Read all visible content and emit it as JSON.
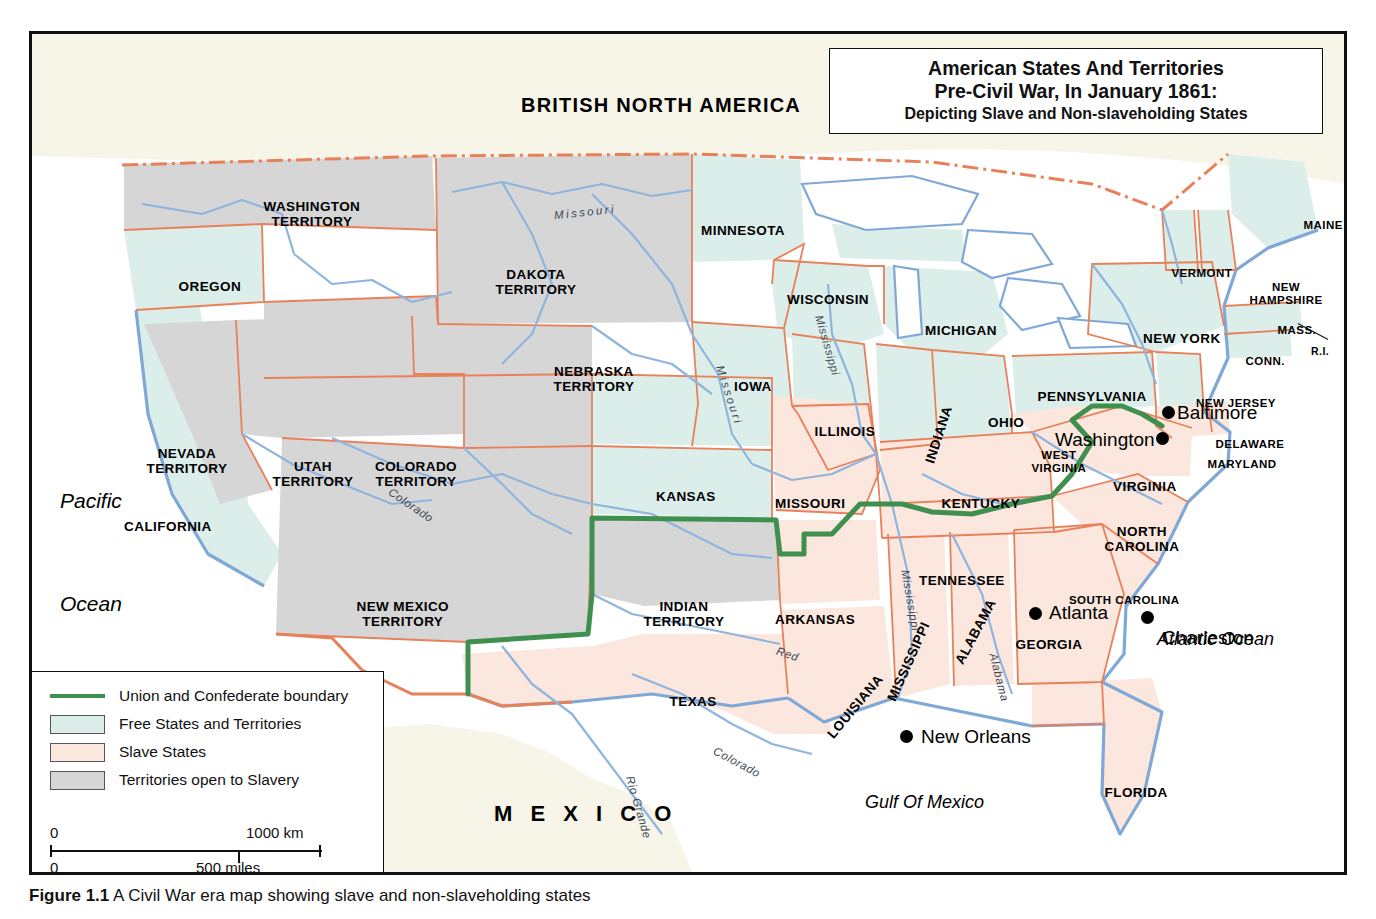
{
  "title": {
    "line1": "American States And Territories",
    "line2": "Pre-Civil War, In January 1861:",
    "line3": "Depicting Slave and Non-slaveholding  States"
  },
  "legend": {
    "items": [
      {
        "key": "line",
        "label": "Union and Confederate boundary",
        "color": "#3f8f4f"
      },
      {
        "key": "swatch",
        "label": "Free States and Territories",
        "color": "#dceee9"
      },
      {
        "key": "swatch",
        "label": "Slave States",
        "color": "#fbe7dd"
      },
      {
        "key": "swatch",
        "label": "Territories open to Slavery",
        "color": "#d6d6d6"
      }
    ]
  },
  "scale": {
    "km_zero": "0",
    "km_max": "1000 km",
    "miles_zero": "0",
    "miles_max": "500 miles"
  },
  "caption": {
    "figure": "Figure 1.1",
    "text": "A Civil War era map showing slave and non-slaveholding states"
  },
  "colors": {
    "free": "#dceee9",
    "slave": "#fbe7dd",
    "territory_open": "#d6d6d6",
    "water": "#ffffff",
    "coast": "#7fa8d6",
    "state_border": "#e8805a",
    "union_confederate_boundary": "#3f8f4f",
    "river": "#8fb4dd",
    "land_outside": "#f7f4e8"
  },
  "countries": [
    {
      "name": "BRITISH NORTH AMERICA",
      "x": 489,
      "y": 60,
      "cls": "country"
    },
    {
      "name": "M E X I C O",
      "x": 462,
      "y": 768,
      "cls": "country wide"
    }
  ],
  "oceans": [
    {
      "name": "Pacific",
      "x": 28,
      "y": 455,
      "cls": "ocean"
    },
    {
      "name": "Ocean",
      "x": 28,
      "y": 558,
      "cls": "ocean"
    },
    {
      "name": "Atlantic Ocean",
      "x": 1125,
      "y": 595,
      "cls": "ocean sm"
    },
    {
      "name": "Gulf Of Mexico",
      "x": 833,
      "y": 758,
      "cls": "ocean sm"
    }
  ],
  "states": [
    {
      "name": "WASHINGTON\nTERRITORY",
      "x": 280,
      "y": 165,
      "cls": "terr"
    },
    {
      "name": "OREGON",
      "x": 178,
      "y": 245,
      "cls": "state"
    },
    {
      "name": "DAKOTA\nTERRITORY",
      "x": 504,
      "y": 233,
      "cls": "terr"
    },
    {
      "name": "MINNESOTA",
      "x": 711,
      "y": 189,
      "cls": "state"
    },
    {
      "name": "WISCONSIN",
      "x": 796,
      "y": 258,
      "cls": "state"
    },
    {
      "name": "MICHIGAN",
      "x": 929,
      "y": 289,
      "cls": "state"
    },
    {
      "name": "NEVADA\nTERRITORY",
      "x": 155,
      "y": 412,
      "cls": "terr"
    },
    {
      "name": "UTAH\nTERRITORY",
      "x": 281,
      "y": 425,
      "cls": "terr"
    },
    {
      "name": "NEBRASKA\nTERRITORY",
      "x": 562,
      "y": 330,
      "cls": "terr"
    },
    {
      "name": "IOWA",
      "x": 721,
      "y": 345,
      "cls": "state"
    },
    {
      "name": "ILLINOIS",
      "x": 813,
      "y": 390,
      "cls": "state"
    },
    {
      "name": "INDIANA",
      "x": 906,
      "y": 393,
      "cls": "state",
      "rot": -72
    },
    {
      "name": "OHIO",
      "x": 974,
      "y": 381,
      "cls": "state"
    },
    {
      "name": "COLORADO\nTERRITORY",
      "x": 384,
      "y": 425,
      "cls": "terr"
    },
    {
      "name": "CALIFORNIA",
      "x": 136,
      "y": 485,
      "cls": "state"
    },
    {
      "name": "KANSAS",
      "x": 654,
      "y": 455,
      "cls": "state"
    },
    {
      "name": "MISSOURI",
      "x": 778,
      "y": 462,
      "cls": "state"
    },
    {
      "name": "KENTUCKY",
      "x": 949,
      "y": 462,
      "cls": "state"
    },
    {
      "name": "WEST\nVIRGINIA",
      "x": 1027,
      "y": 415,
      "cls": "state sm"
    },
    {
      "name": "VIRGINIA",
      "x": 1113,
      "y": 445,
      "cls": "state"
    },
    {
      "name": "NEW MEXICO\nTERRITORY",
      "x": 371,
      "y": 565,
      "cls": "terr"
    },
    {
      "name": "INDIAN\nTERRITORY",
      "x": 652,
      "y": 565,
      "cls": "terr"
    },
    {
      "name": "ARKANSAS",
      "x": 783,
      "y": 578,
      "cls": "state"
    },
    {
      "name": "TENNESSEE",
      "x": 930,
      "y": 539,
      "cls": "state"
    },
    {
      "name": "NORTH\nCAROLINA",
      "x": 1110,
      "y": 490,
      "cls": "state"
    },
    {
      "name": "SOUTH CAROLINA",
      "x": 1092,
      "y": 560,
      "cls": "state sm"
    },
    {
      "name": "MISSISSIPPI",
      "x": 876,
      "y": 620,
      "cls": "state",
      "rot": -66
    },
    {
      "name": "ALABAMA",
      "x": 943,
      "y": 590,
      "cls": "state",
      "rot": -62
    },
    {
      "name": "LOUISIANA",
      "x": 823,
      "y": 665,
      "cls": "state",
      "rot": -50
    },
    {
      "name": "GEORGIA",
      "x": 1017,
      "y": 603,
      "cls": "state"
    },
    {
      "name": "TEXAS",
      "x": 661,
      "y": 660,
      "cls": "state"
    },
    {
      "name": "FLORIDA",
      "x": 1104,
      "y": 751,
      "cls": "state"
    },
    {
      "name": "PENNSYLVANIA",
      "x": 1060,
      "y": 355,
      "cls": "state"
    },
    {
      "name": "NEW YORK",
      "x": 1150,
      "y": 297,
      "cls": "state"
    },
    {
      "name": "NEW JERSEY",
      "x": 1204,
      "y": 363,
      "cls": "state sm"
    },
    {
      "name": "DELAWARE",
      "x": 1218,
      "y": 404,
      "cls": "state sm"
    },
    {
      "name": "MARYLAND",
      "x": 1210,
      "y": 424,
      "cls": "state sm"
    },
    {
      "name": "MAINE",
      "x": 1291,
      "y": 185,
      "cls": "state sm"
    },
    {
      "name": "VERMONT",
      "x": 1170,
      "y": 233,
      "cls": "state sm"
    },
    {
      "name": "NEW\nHAMPSHIRE",
      "x": 1254,
      "y": 247,
      "cls": "state sm"
    },
    {
      "name": "MASS.",
      "x": 1265,
      "y": 290,
      "cls": "state sm"
    },
    {
      "name": "CONN.",
      "x": 1233,
      "y": 321,
      "cls": "state sm"
    },
    {
      "name": "R.I.",
      "x": 1288,
      "y": 312,
      "cls": "state xs"
    }
  ],
  "cities": [
    {
      "name": "Washington",
      "dot_x": 1130,
      "dot_y": 404,
      "lx": 1013,
      "ly": 395
    },
    {
      "name": "Baltimore",
      "dot_x": 1136,
      "dot_y": 378,
      "lx": 1145,
      "ly": 368
    },
    {
      "name": "Atlanta",
      "dot_x": 1003,
      "dot_y": 579,
      "lx": 1017,
      "ly": 568
    },
    {
      "name": "Charleston",
      "dot_x": 1115,
      "dot_y": 583,
      "lx": 1130,
      "ly": 593
    },
    {
      "name": "New Orleans",
      "dot_x": 874,
      "dot_y": 702,
      "lx": 889,
      "ly": 692
    }
  ],
  "rivers": [
    {
      "name": "Missouri",
      "x": 553,
      "y": 172,
      "rot": -6,
      "cls": "river sp"
    },
    {
      "name": "Missouri",
      "x": 697,
      "y": 355,
      "rot": 72,
      "cls": "river sp"
    },
    {
      "name": "Mississippi",
      "x": 795,
      "y": 305,
      "rot": 74,
      "cls": "river"
    },
    {
      "name": "Mississippi",
      "x": 878,
      "y": 560,
      "rot": 80,
      "cls": "river"
    },
    {
      "name": "Colorado",
      "x": 378,
      "y": 465,
      "rot": 34,
      "cls": "river"
    },
    {
      "name": "Colorado",
      "x": 704,
      "y": 722,
      "rot": 28,
      "cls": "river"
    },
    {
      "name": "Red",
      "x": 755,
      "y": 614,
      "rot": 18,
      "cls": "river"
    },
    {
      "name": "Rio Grande",
      "x": 606,
      "y": 767,
      "rot": 74,
      "cls": "river"
    },
    {
      "name": "Alabama",
      "x": 967,
      "y": 637,
      "rot": 76,
      "cls": "river"
    }
  ]
}
